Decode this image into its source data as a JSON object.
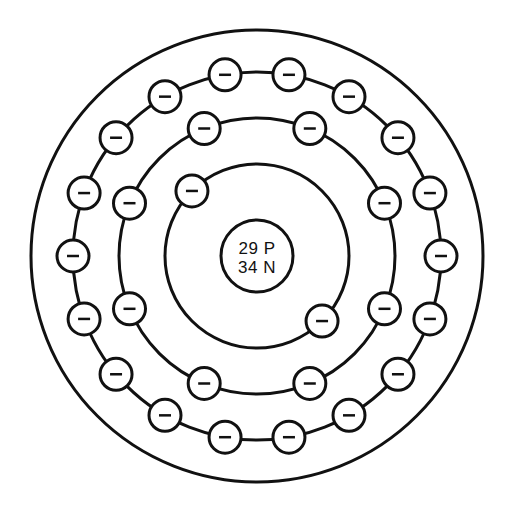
{
  "diagram": {
    "kind": "bohr-atomic-model",
    "background_color": "#ffffff",
    "line_color": "#111111",
    "canvas": {
      "width": 516,
      "height": 506
    },
    "center": {
      "x": 257,
      "y": 256
    },
    "nucleus": {
      "label_name": "nucleus",
      "radius": 36,
      "stroke_width": 3,
      "line1": "29 P",
      "line2": "34 N",
      "protons": 29,
      "neutrons": 34
    },
    "electron": {
      "radius": 16,
      "stroke_width": 3,
      "sign": "−",
      "sign_half_width": 6,
      "sign_stroke_width": 2.5
    },
    "shells": [
      {
        "name": "shell-1",
        "index": 1,
        "radius": 92,
        "stroke_width": 3,
        "electron_count": 2,
        "start_angle_deg": 135,
        "electron_angles_deg": [
          135,
          315
        ]
      },
      {
        "name": "shell-2",
        "index": 2,
        "radius": 138,
        "stroke_width": 3,
        "electron_count": 8,
        "start_angle_deg": 112.5,
        "electron_angles_deg": [
          112.5,
          67.5,
          22.5,
          337.5,
          292.5,
          247.5,
          202.5,
          157.5
        ]
      },
      {
        "name": "shell-3",
        "index": 3,
        "radius": 184,
        "stroke_width": 3,
        "electron_count": 18,
        "start_angle_deg": 100,
        "electron_angles_deg": [
          100,
          80,
          60,
          40,
          20,
          0,
          340,
          320,
          300,
          280,
          260,
          240,
          220,
          200,
          180,
          160,
          140,
          120
        ]
      },
      {
        "name": "shell-4",
        "index": 4,
        "radius": 226,
        "stroke_width": 3,
        "electron_count": 0,
        "start_angle_deg": 90,
        "electron_angles_deg": []
      }
    ],
    "chart_data": {
      "type": "diagram",
      "title": "Bohr model of a copper atom",
      "nucleus_labels": [
        "29 P",
        "34 N"
      ],
      "categories": [
        "shell-1",
        "shell-2",
        "shell-3",
        "shell-4"
      ],
      "values": [
        2,
        8,
        18,
        0
      ],
      "electron_configuration": [
        2,
        8,
        18,
        0
      ],
      "total_electrons_drawn": 28,
      "protons": 29,
      "neutrons": 34,
      "shell_radii": [
        92,
        138,
        184,
        226
      ],
      "legend": [
        "− = electron"
      ],
      "grid": false
    }
  }
}
